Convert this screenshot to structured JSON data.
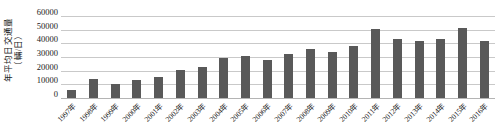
{
  "chart_data": {
    "type": "bar",
    "title": "",
    "subtitle": "",
    "xlabel": "",
    "ylabel": "年平均日交通量\n（輛/日）",
    "ylabel_line1": "年平均日交通量",
    "ylabel_line2": "（輛/日）",
    "ylim": [
      0,
      60000
    ],
    "ytick_labels": [
      "60000",
      "50000",
      "40000",
      "30000",
      "20000",
      "10000",
      "0"
    ],
    "ytick_values": [
      60000,
      50000,
      40000,
      30000,
      20000,
      10000,
      0
    ],
    "grid": true,
    "legend": false,
    "legend_position": "none",
    "bar_color": "#595959",
    "gridline_color": "#c9c9c9",
    "background_color": "#ffffff",
    "categories": [
      "1997年",
      "1998年",
      "1999年",
      "2000年",
      "2001年",
      "2002年",
      "2003年",
      "2004年",
      "2005年",
      "2006年",
      "2007年",
      "2008年",
      "2009年",
      "2010年",
      "2011年",
      "2012年",
      "2013年",
      "2014年",
      "2015年",
      "2016年"
    ],
    "values": [
      5500,
      14200,
      10600,
      13200,
      15600,
      20500,
      23000,
      29000,
      30500,
      27500,
      32000,
      35500,
      33500,
      38000,
      50500,
      43500,
      42000,
      43000,
      51000,
      42000
    ],
    "series": [
      {
        "name": "年平均日交通量",
        "values": [
          5500,
          14200,
          10600,
          13200,
          15600,
          20500,
          23000,
          29000,
          30500,
          27500,
          32000,
          35500,
          33500,
          38000,
          50500,
          43500,
          42000,
          43000,
          51000,
          42000
        ]
      }
    ]
  }
}
